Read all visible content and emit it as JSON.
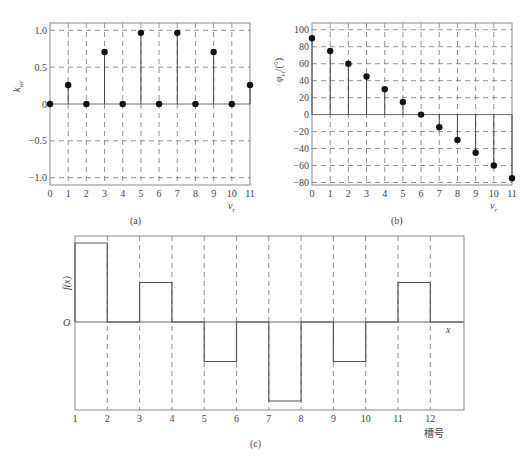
{
  "chart_data": [
    {
      "id": "a",
      "type": "stem",
      "caption": "(a)",
      "xlabel": "ν_r",
      "ylabel": "k_wr",
      "x": [
        0,
        1,
        2,
        3,
        4,
        5,
        6,
        7,
        8,
        9,
        10,
        11
      ],
      "values": [
        0,
        0.259,
        0,
        0.707,
        0,
        0.966,
        0,
        0.966,
        0,
        0.707,
        0,
        0.259
      ],
      "x_ticks": [
        "0",
        "1",
        "2",
        "3",
        "4",
        "5",
        "6",
        "7",
        "8",
        "9",
        "10",
        "11"
      ],
      "y_ticks": [
        "1.0",
        "0.5",
        "0",
        "−0.5",
        "−1.0"
      ],
      "y_tick_values": [
        1.0,
        0.5,
        0,
        -0.5,
        -1.0
      ],
      "xlim": [
        0,
        11
      ],
      "ylim": [
        -1.1,
        1.1
      ],
      "grid": true
    },
    {
      "id": "b",
      "type": "stem",
      "caption": "(b)",
      "xlabel": "ν_r",
      "ylabel": "φ_vl/(°)",
      "x": [
        0,
        1,
        2,
        3,
        4,
        5,
        6,
        7,
        8,
        9,
        10,
        11
      ],
      "values": [
        90,
        75,
        60,
        45,
        30,
        15,
        0,
        -15,
        -30,
        -45,
        -60,
        -75
      ],
      "x_ticks": [
        "0",
        "1",
        "2",
        "3",
        "4",
        "5",
        "6",
        "7",
        "8",
        "9",
        "10",
        "11"
      ],
      "y_ticks": [
        "100",
        "80",
        "60",
        "40",
        "20",
        "0",
        "−20",
        "−40",
        "−60",
        "−80"
      ],
      "y_tick_values": [
        100,
        80,
        60,
        40,
        20,
        0,
        -20,
        -40,
        -60,
        -80
      ],
      "xlim": [
        0,
        11
      ],
      "ylim": [
        -83,
        108
      ],
      "grid": true
    },
    {
      "id": "c",
      "type": "step",
      "caption": "(c)",
      "xlabel": "x",
      "xlabel2": "槽号",
      "ylabel": "f(x)",
      "origin_label": "O",
      "x_ticks": [
        "1",
        "2",
        "3",
        "4",
        "5",
        "6",
        "7",
        "8",
        "9",
        "10",
        "11",
        "12"
      ],
      "segments": [
        {
          "from": 1,
          "to": 2,
          "value": 1.0
        },
        {
          "from": 2,
          "to": 3,
          "value": 0
        },
        {
          "from": 3,
          "to": 4,
          "value": 0.5
        },
        {
          "from": 4,
          "to": 5,
          "value": 0
        },
        {
          "from": 5,
          "to": 6,
          "value": -0.5
        },
        {
          "from": 6,
          "to": 7,
          "value": 0
        },
        {
          "from": 7,
          "to": 8,
          "value": -1.0
        },
        {
          "from": 8,
          "to": 9,
          "value": 0
        },
        {
          "from": 9,
          "to": 10,
          "value": -0.5
        },
        {
          "from": 10,
          "to": 11,
          "value": 0
        },
        {
          "from": 11,
          "to": 12,
          "value": 0.5
        },
        {
          "from": 12,
          "to": 13,
          "value": 0
        }
      ],
      "grid": "vertical dashed"
    }
  ],
  "labels": {
    "a_ylabel_main": "k",
    "a_ylabel_sub": "wr",
    "b_ylabel_main": "φ",
    "b_ylabel_sub": "vl",
    "b_ylabel_unit": "/(°)",
    "nu_main": "ν",
    "nu_sub": "r",
    "c_ylabel": "f(x)",
    "c_origin": "O",
    "c_xlabel": "x",
    "c_xlabel2": "槽号",
    "cap_a": "(a)",
    "cap_b": "(b)",
    "cap_c": "(c)"
  }
}
